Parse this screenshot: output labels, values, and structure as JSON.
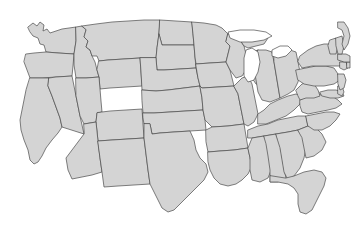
{
  "map": {
    "title": "United States state boundary map",
    "projection": "albers-usa",
    "background_color": "#ffffff",
    "state_fill_color": "#d4d4d4",
    "state_border_color": "#4a4a4a",
    "nation_border_color": "#3a3a3a",
    "lake_fill_color": "#ffffff",
    "width": 352,
    "height": 228,
    "labels_visible": false,
    "legend_visible": false,
    "region_count": 49,
    "regions": [
      {
        "code": "WA",
        "name": "Washington",
        "path": "M28,27 L33,23 L37,26 L40,22 L44,25 L43,31 L47,29 L50,33 L56,31 L62,29 L69,28 L76,27 L76,41 L74,54 L58,53 L46,52 L44,45 L40,44 L38,38 L33,36 L30,32 Z"
      },
      {
        "code": "OR",
        "name": "Oregon",
        "path": "M26,54 L34,53 L46,52 L58,53 L74,54 L73,66 L72,76 L56,77 L42,78 L30,78 L27,70 L24,62 Z"
      },
      {
        "code": "CA",
        "name": "California",
        "path": "M30,78 L42,78 L49,78 L48,86 L52,96 L56,107 L60,118 L62,127 L58,133 L52,140 L46,148 L42,156 L38,162 L34,164 L30,160 L28,150 L24,140 L21,130 L20,120 L22,110 L24,100 L26,90 Z"
      },
      {
        "code": "NV",
        "name": "Nevada",
        "path": "M49,78 L56,77 L72,76 L76,96 L80,116 L84,134 L62,127 L60,118 L56,107 L52,96 L48,86 Z"
      },
      {
        "code": "ID",
        "name": "Idaho",
        "path": "M76,27 L82,26 L86,30 L84,37 L88,41 L86,47 L90,50 L92,56 L95,62 L97,70 L99,77 L86,78 L76,78 L74,65 L74,54 L76,41 Z"
      },
      {
        "code": "MT",
        "name": "Montana",
        "path": "M82,26 L96,24 L112,22 L128,21 L144,20 L160,20 L159,34 L157,48 L156,58 L140,58 L124,59 L108,60 L99,61 L97,56 L92,56 L90,50 L86,47 L88,41 L84,37 L86,30 Z"
      },
      {
        "code": "WY",
        "name": "Wyoming",
        "path": "M99,61 L108,60 L124,59 L140,58 L141,72 L142,86 L126,87 L110,88 L100,89 L99,77 L97,70 Z"
      },
      {
        "code": "UT",
        "name": "Utah",
        "path": "M76,78 L86,78 L99,77 L100,89 L101,101 L102,112 L97,113 L96,122 L84,124 L80,116 L76,96 Z"
      },
      {
        "code": "CO",
        "name": "Colorado",
        "path": "M102,112 L110,111 L126,110 L142,109 L143,124 L144,138 L128,139 L112,140 L98,141 L96,122 L97,113 Z"
      },
      {
        "code": "AZ",
        "name": "Arizona",
        "path": "M84,124 L96,122 L98,141 L100,158 L102,172 L92,175 L82,177 L72,179 L68,170 L66,158 L84,134 Z"
      },
      {
        "code": "NM",
        "name": "New Mexico",
        "path": "M98,141 L112,140 L128,139 L144,138 L146,154 L148,170 L150,184 L134,185 L118,186 L104,187 L102,172 L100,158 Z"
      },
      {
        "code": "ND",
        "name": "North Dakota",
        "path": "M160,20 L176,21 L192,22 L193,34 L194,45 L178,45 L162,45 L159,34 Z"
      },
      {
        "code": "SD",
        "name": "South Dakota",
        "path": "M159,34 L162,45 L178,45 L194,45 L195,57 L196,68 L180,69 L164,70 L157,70 L156,58 L157,48 Z"
      },
      {
        "code": "NE",
        "name": "Nebraska",
        "path": "M156,58 L157,70 L164,70 L180,69 L196,68 L198,78 L200,86 L184,88 L168,90 L156,91 L142,90 L141,72 L140,58 Z"
      },
      {
        "code": "KS",
        "name": "Kansas",
        "path": "M142,90 L156,91 L168,90 L184,88 L200,86 L202,98 L203,110 L186,111 L170,112 L154,113 L143,113 L142,101 Z"
      },
      {
        "code": "OK",
        "name": "Oklahoma",
        "path": "M143,113 L154,113 L170,112 L186,111 L203,110 L205,120 L206,130 L190,131 L174,132 L160,133 L152,134 L150,124 L144,124 L143,118 Z"
      },
      {
        "code": "TX",
        "name": "Texas",
        "path": "M150,124 L152,134 L160,133 L174,132 L190,131 L194,140 L196,150 L200,158 L206,164 L208,172 L204,180 L198,186 L192,192 L186,198 L180,204 L174,210 L168,212 L162,208 L158,200 L154,192 L150,184 L148,170 L146,154 L144,138 L144,124 Z"
      },
      {
        "code": "MN",
        "name": "Minnesota",
        "path": "M192,22 L204,23 L216,25 L222,28 L228,34 L226,42 L230,46 L228,54 L226,62 L210,63 L196,64 L195,57 L194,45 L193,34 Z"
      },
      {
        "code": "IA",
        "name": "Iowa",
        "path": "M196,64 L210,63 L226,62 L230,70 L232,78 L234,86 L218,87 L202,88 L200,86 L198,78 Z"
      },
      {
        "code": "MO",
        "name": "Missouri",
        "path": "M200,86 L202,88 L218,87 L234,86 L238,94 L240,104 L242,114 L244,124 L228,126 L212,127 L205,120 L203,110 L202,98 Z"
      },
      {
        "code": "AR",
        "name": "Arkansas",
        "path": "M206,130 L212,127 L228,126 L244,124 L246,136 L248,148 L234,150 L220,151 L208,152 L206,142 Z"
      },
      {
        "code": "LA",
        "name": "Louisiana",
        "path": "M208,152 L220,151 L234,150 L248,148 L250,158 L252,166 L248,174 L242,180 L236,184 L228,186 L220,184 L214,178 L210,170 L208,162 Z"
      },
      {
        "code": "WI",
        "name": "Wisconsin",
        "path": "M228,34 L234,36 L240,40 L244,46 L246,54 L248,62 L246,70 L242,76 L236,78 L230,70 L226,62 L228,54 L230,46 L226,42 Z"
      },
      {
        "code": "IL",
        "name": "Illinois",
        "path": "M234,86 L242,78 L248,76 L252,84 L254,94 L256,104 L258,114 L254,122 L248,126 L244,124 L242,114 L240,104 L238,94 Z"
      },
      {
        "code": "MI",
        "name": "Michigan",
        "path": "M246,54 L252,52 L258,50 L264,52 L268,56 L272,62 L274,70 L272,78 L268,84 L262,86 L256,84 L252,78 L250,70 L248,62 Z"
      },
      {
        "code": "MI-UP",
        "name": "Michigan Upper Peninsula",
        "path": "M234,36 L244,34 L254,33 L264,34 L268,38 L264,44 L256,46 L248,48 L244,46 L240,40 Z"
      },
      {
        "code": "IN",
        "name": "Indiana",
        "path": "M258,50 L266,50 L272,52 L274,62 L276,74 L278,86 L280,98 L270,102 L262,100 L258,92 L256,80 L254,68 Z"
      },
      {
        "code": "OH",
        "name": "Ohio",
        "path": "M274,52 L282,50 L290,50 L296,52 L298,62 L300,72 L298,82 L294,90 L288,94 L280,98 L278,86 L276,74 L274,62 Z"
      },
      {
        "code": "KY",
        "name": "Kentucky",
        "path": "M258,114 L264,110 L270,104 L278,100 L288,96 L296,94 L302,96 L300,104 L294,110 L286,116 L276,120 L266,124 L258,124 Z"
      },
      {
        "code": "TN",
        "name": "Tennessee",
        "path": "M248,130 L258,126 L268,124 L278,120 L288,118 L298,116 L306,116 L308,126 L298,130 L288,132 L276,134 L264,136 L252,138 L248,138 Z"
      },
      {
        "code": "MS",
        "name": "Mississippi",
        "path": "M248,148 L252,138 L264,136 L268,144 L270,156 L272,168 L268,178 L260,182 L252,180 L250,170 L250,158 Z"
      },
      {
        "code": "AL",
        "name": "Alabama",
        "path": "M264,136 L276,134 L280,144 L282,156 L284,168 L286,178 L278,182 L270,182 L270,170 L268,156 L266,144 Z"
      },
      {
        "code": "GA",
        "name": "Georgia",
        "path": "M276,134 L288,132 L298,130 L304,138 L306,148 L304,158 L300,168 L294,176 L288,180 L284,172 L282,160 L280,148 Z"
      },
      {
        "code": "FL",
        "name": "Florida",
        "path": "M286,178 L294,176 L304,172 L314,170 L322,172 L326,178 L324,186 L320,194 L316,202 L312,210 L306,214 L300,212 L298,204 L298,194 L294,188 L288,184 L278,182 L270,182 L270,176 Z"
      },
      {
        "code": "SC",
        "name": "South Carolina",
        "path": "M298,130 L308,126 L316,128 L322,134 L326,142 L322,150 L314,156 L306,158 L304,148 L302,138 Z"
      },
      {
        "code": "NC",
        "name": "North Carolina",
        "path": "M306,116 L316,114 L326,112 L334,112 L340,114 L336,120 L330,126 L322,130 L314,130 L308,126 Z"
      },
      {
        "code": "VA",
        "name": "Virginia",
        "path": "M300,100 L308,96 L316,94 L324,94 L332,96 L338,100 L342,104 L336,108 L328,110 L318,112 L308,114 L302,112 L300,106 Z"
      },
      {
        "code": "WV",
        "name": "West Virginia",
        "path": "M296,90 L302,84 L308,82 L314,84 L318,90 L320,96 L314,98 L306,98 L300,100 L298,96 Z"
      },
      {
        "code": "MD",
        "name": "Maryland",
        "path": "M320,92 L328,90 L336,90 L342,92 L344,96 L338,98 L330,98 L322,96 Z"
      },
      {
        "code": "DE",
        "name": "Delaware",
        "path": "M338,86 L342,86 L344,92 L342,96 L338,94 Z"
      },
      {
        "code": "PA",
        "name": "Pennsylvania",
        "path": "M296,70 L306,68 L316,66 L326,66 L334,68 L338,74 L340,80 L334,84 L324,86 L314,86 L304,84 L298,80 Z"
      },
      {
        "code": "NJ",
        "name": "New Jersey",
        "path": "M338,74 L344,74 L346,80 L344,88 L340,90 L338,84 Z"
      },
      {
        "code": "NY",
        "name": "New York",
        "path": "M300,56 L308,50 L316,46 L324,44 L332,44 L338,48 L342,54 L344,60 L340,66 L332,66 L322,66 L312,66 L302,68 L298,62 Z"
      },
      {
        "code": "CT",
        "name": "Connecticut",
        "path": "M340,62 L346,62 L348,68 L344,70 L340,68 Z"
      },
      {
        "code": "RI",
        "name": "Rhode Island",
        "path": "M347,62 L350,62 L350,68 L347,68 Z"
      },
      {
        "code": "MA",
        "name": "Massachusetts",
        "path": "M338,54 L346,54 L350,56 L350,62 L344,62 L338,60 Z"
      },
      {
        "code": "VT",
        "name": "Vermont",
        "path": "M330,40 L336,38 L338,46 L336,54 L330,54 L328,46 Z"
      },
      {
        "code": "NH",
        "name": "New Hampshire",
        "path": "M336,38 L342,36 L344,46 L342,54 L338,54 L336,46 Z"
      },
      {
        "code": "ME",
        "name": "Maine",
        "path": "M338,22 L344,22 L348,28 L350,36 L348,44 L344,50 L342,44 L344,36 L342,30 L338,28 Z"
      }
    ],
    "lakes": [
      {
        "name": "Lake Michigan",
        "path": "M246,50 L252,48 L258,52 L260,62 L258,72 L254,80 L248,82 L244,76 L244,66 L244,58 Z"
      },
      {
        "name": "Lake Superior",
        "path": "M228,32 L240,30 L254,30 L266,32 L272,36 L264,40 L252,42 L240,42 L230,38 Z"
      },
      {
        "name": "Lake Huron / Erie",
        "path": "M272,50 L280,46 L288,46 L292,50 L286,56 L278,58 L272,56 Z"
      }
    ]
  }
}
